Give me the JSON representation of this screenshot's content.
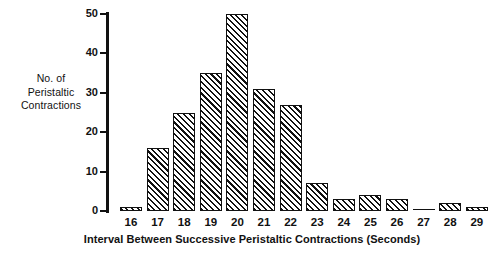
{
  "chart_data": {
    "type": "bar",
    "title": "",
    "subtitle": "",
    "xlabel": "Interval Between Successive Peristaltic Contractions (Seconds)",
    "ylabel": "No. of Peristaltic Contractions",
    "ylabel_lines": [
      "No. of",
      "Peristaltic",
      "Contractions"
    ],
    "categories": [
      "16",
      "17",
      "18",
      "19",
      "20",
      "21",
      "22",
      "23",
      "24",
      "25",
      "26",
      "27",
      "28",
      "29"
    ],
    "values": [
      1,
      16,
      25,
      35,
      50,
      31,
      27,
      7,
      3,
      4,
      3,
      0,
      2,
      1
    ],
    "ylim": [
      0,
      50
    ],
    "yticks": [
      0,
      10,
      20,
      30,
      40,
      50
    ],
    "ytick_labels": [
      "0",
      "10",
      "20",
      "30",
      "40",
      "50"
    ],
    "grid": false,
    "legend": false,
    "bar_fill": "diagonal-hatch",
    "bar_color": "#111111",
    "background": "#ffffff"
  }
}
